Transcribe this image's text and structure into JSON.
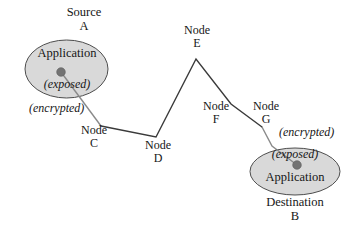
{
  "diagram": {
    "type": "network-path-diagram",
    "colors": {
      "ellipse_fill": "#d9d9d9",
      "ellipse_stroke": "#4d4d4d",
      "path_stroke": "#3a3a3a",
      "endpoint_link_stroke": "#808080",
      "dot_fill": "#737373",
      "text": "#161616",
      "background": "#ffffff"
    },
    "source": {
      "caption_line1": "Source",
      "caption_line2": "A",
      "inner_title": "Application",
      "inner_state": "(exposed)",
      "outer_state": "(encrypted)"
    },
    "destination": {
      "caption_line1": "Destination",
      "caption_line2": "B",
      "inner_title": "Application",
      "inner_state": "(exposed)",
      "outer_state": "(encrypted)"
    },
    "nodes": [
      {
        "id": "C",
        "line1": "Node",
        "line2": "C"
      },
      {
        "id": "D",
        "line1": "Node",
        "line2": "D"
      },
      {
        "id": "E",
        "line1": "Node",
        "line2": "E"
      },
      {
        "id": "F",
        "line1": "Node",
        "line2": "F"
      },
      {
        "id": "G",
        "line1": "Node",
        "line2": "G"
      }
    ]
  }
}
